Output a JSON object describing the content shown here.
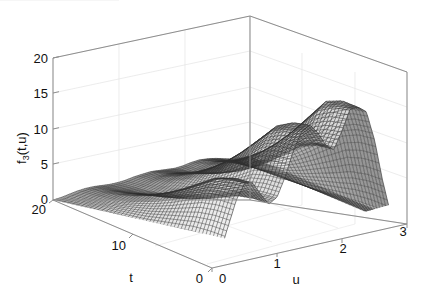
{
  "figure": {
    "kind": "3d-mesh-surface-plot",
    "background_color": "#ffffff",
    "mesh_color": "#3a3a3a",
    "grid_color": "#e2e2e2",
    "axis_color": "#9a9a9a",
    "text_color": "#111111"
  },
  "axes": {
    "z": {
      "label": "f",
      "label_sub": "3",
      "label_tail": "(t,u)",
      "label_full": "f3(t,u)",
      "ticks": [
        "20",
        "15",
        "10",
        "5",
        "0"
      ],
      "tick_values": [
        20,
        15,
        10,
        5,
        0
      ],
      "range": [
        0,
        20
      ]
    },
    "t": {
      "label": "t",
      "ticks": [
        "20",
        "10",
        "0"
      ],
      "tick_values": [
        20,
        10,
        0
      ],
      "range": [
        0,
        20
      ],
      "direction": "decreasing-left-to-right"
    },
    "u": {
      "label": "u",
      "ticks": [
        "0",
        "1",
        "2",
        "3"
      ],
      "tick_values": [
        0,
        1,
        2,
        3
      ],
      "range": [
        0,
        3
      ],
      "direction": "increasing-left-to-right"
    }
  },
  "chart_data": {
    "type": "surface",
    "title": "",
    "xlabel": "u",
    "ylabel": "t",
    "zlabel": "f3(t,u)",
    "xlim": [
      0,
      3
    ],
    "ylim": [
      0,
      20
    ],
    "zlim": [
      0,
      20
    ],
    "grid": true,
    "legend": null,
    "legend_position": "none",
    "u_samples": [
      0.0,
      0.125,
      0.25,
      0.375,
      0.5,
      0.625,
      0.75,
      0.875,
      1.0,
      1.125,
      1.25,
      1.375,
      1.5,
      1.625,
      1.75,
      1.875,
      2.0,
      2.125,
      2.25,
      2.375,
      2.5,
      2.625,
      2.75,
      2.875,
      3.0
    ],
    "t_samples": [
      20,
      18,
      16,
      14,
      12,
      10,
      8,
      6,
      4,
      2,
      0
    ],
    "series": [
      {
        "name": "t=20",
        "values": [
          0.0,
          0.1,
          0.3,
          0.5,
          0.6,
          0.6,
          0.5,
          0.4,
          0.4,
          0.5,
          0.7,
          0.8,
          0.9,
          0.8,
          0.7,
          0.6,
          0.7,
          0.9,
          1.0,
          0.9,
          0.7,
          0.4,
          0.1,
          0.0,
          0.0
        ]
      },
      {
        "name": "t=18",
        "values": [
          0.0,
          0.2,
          0.5,
          0.8,
          1.0,
          1.0,
          0.8,
          0.7,
          0.7,
          0.9,
          1.2,
          1.4,
          1.5,
          1.4,
          1.2,
          1.1,
          1.3,
          1.6,
          1.7,
          1.5,
          1.1,
          0.6,
          0.2,
          0.0,
          0.0
        ]
      },
      {
        "name": "t=16",
        "values": [
          0.0,
          0.3,
          0.8,
          1.3,
          1.6,
          1.6,
          1.3,
          1.1,
          1.1,
          1.5,
          2.0,
          2.4,
          2.5,
          2.3,
          2.0,
          1.8,
          2.2,
          2.6,
          2.8,
          2.5,
          1.9,
          1.0,
          0.3,
          0.0,
          0.0
        ]
      },
      {
        "name": "t=14",
        "values": [
          0.0,
          0.4,
          1.2,
          1.9,
          2.4,
          2.4,
          2.0,
          1.6,
          1.7,
          2.3,
          3.1,
          3.6,
          3.8,
          3.5,
          3.0,
          2.8,
          3.3,
          4.0,
          4.3,
          3.8,
          2.9,
          1.5,
          0.4,
          0.0,
          0.0
        ]
      },
      {
        "name": "t=12",
        "values": [
          0.0,
          0.6,
          1.7,
          2.8,
          3.4,
          3.4,
          2.8,
          2.3,
          2.5,
          3.3,
          4.4,
          5.2,
          5.4,
          5.0,
          4.3,
          4.0,
          4.8,
          5.7,
          6.1,
          5.4,
          4.1,
          2.2,
          0.6,
          0.0,
          0.0
        ]
      },
      {
        "name": "t=10",
        "values": [
          0.0,
          0.8,
          2.3,
          3.8,
          4.7,
          4.6,
          3.8,
          3.1,
          3.4,
          4.5,
          6.0,
          7.0,
          7.4,
          6.8,
          5.9,
          5.5,
          6.5,
          7.8,
          8.3,
          7.4,
          5.6,
          3.0,
          0.8,
          0.0,
          0.0
        ]
      },
      {
        "name": "t=8",
        "values": [
          0.0,
          1.1,
          3.1,
          5.0,
          6.2,
          6.1,
          5.0,
          4.1,
          4.5,
          6.0,
          7.9,
          9.3,
          9.7,
          9.0,
          7.8,
          7.3,
          8.6,
          10.3,
          11.0,
          9.8,
          7.4,
          4.0,
          1.1,
          0.0,
          0.0
        ]
      },
      {
        "name": "t=6",
        "values": [
          0.0,
          1.4,
          3.9,
          6.4,
          7.9,
          7.8,
          6.4,
          5.2,
          5.7,
          7.6,
          10.1,
          11.8,
          12.4,
          11.4,
          9.9,
          9.3,
          11.0,
          13.1,
          14.0,
          12.4,
          9.4,
          5.0,
          1.4,
          0.0,
          0.0
        ]
      },
      {
        "name": "t=4",
        "values": [
          0.0,
          1.7,
          4.7,
          7.8,
          9.6,
          9.5,
          7.8,
          6.4,
          7.0,
          9.3,
          12.3,
          14.4,
          15.1,
          13.9,
          12.1,
          11.3,
          13.4,
          16.0,
          17.0,
          15.1,
          11.4,
          6.1,
          1.7,
          0.0,
          0.0
        ]
      },
      {
        "name": "t=2",
        "values": [
          0.0,
          1.8,
          5.2,
          8.5,
          10.5,
          10.4,
          8.5,
          7.0,
          7.6,
          10.1,
          13.4,
          15.7,
          16.5,
          15.2,
          13.2,
          12.4,
          14.6,
          17.4,
          18.0,
          16.5,
          12.5,
          6.7,
          1.9,
          0.0,
          0.0
        ]
      },
      {
        "name": "t=0",
        "values": [
          0.0,
          1.9,
          5.4,
          8.8,
          10.9,
          10.7,
          8.8,
          7.2,
          7.9,
          10.5,
          13.9,
          16.3,
          17.1,
          15.7,
          13.7,
          12.8,
          15.2,
          18.0,
          18.0,
          17.1,
          12.9,
          6.9,
          1.9,
          0.0,
          0.0
        ]
      }
    ]
  }
}
